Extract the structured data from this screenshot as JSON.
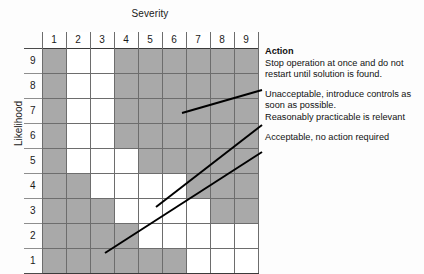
{
  "axes": {
    "x_title": "Severity",
    "y_title": "Likelihood",
    "x_ticks": [
      "1",
      "2",
      "3",
      "4",
      "5",
      "6",
      "7",
      "8",
      "9"
    ],
    "y_ticks": [
      "9",
      "8",
      "7",
      "6",
      "5",
      "4",
      "3",
      "2",
      "1"
    ]
  },
  "legend": {
    "action_heading": "Action",
    "action_line1": "Stop operation at once and do not",
    "action_line2": "restart until solution is found.",
    "unacceptable_line1": "Unacceptable, introduce controls as",
    "unacceptable_line2": "soon as possible.",
    "unacceptable_line3": "Reasonably practicable is relevant",
    "acceptable_line1": "Acceptable, no action required"
  },
  "colors": {
    "shaded_cell": "#a9a9a9",
    "empty_cell": "#ffffff",
    "grid_line": "#6d6d6d",
    "leader_line": "#000000",
    "text": "#111111"
  },
  "chart_data": {
    "type": "heatmap",
    "xlabel": "Severity",
    "ylabel": "Likelihood",
    "x": [
      1,
      2,
      3,
      4,
      5,
      6,
      7,
      8,
      9
    ],
    "y": [
      9,
      8,
      7,
      6,
      5,
      4,
      3,
      2,
      1
    ],
    "grid": true,
    "legend_position": "right",
    "value_labels": {
      "1": "shaded",
      "0": "unshaded"
    },
    "rows": [
      {
        "likelihood": 9,
        "values": [
          1,
          0,
          0,
          1,
          1,
          1,
          1,
          1,
          1
        ]
      },
      {
        "likelihood": 8,
        "values": [
          1,
          0,
          0,
          1,
          1,
          1,
          1,
          1,
          1
        ]
      },
      {
        "likelihood": 7,
        "values": [
          1,
          0,
          0,
          1,
          1,
          1,
          1,
          1,
          1
        ]
      },
      {
        "likelihood": 6,
        "values": [
          1,
          0,
          0,
          1,
          1,
          1,
          1,
          1,
          1
        ]
      },
      {
        "likelihood": 5,
        "values": [
          1,
          0,
          0,
          0,
          1,
          1,
          1,
          1,
          1
        ]
      },
      {
        "likelihood": 4,
        "values": [
          1,
          1,
          0,
          0,
          0,
          0,
          1,
          1,
          1
        ]
      },
      {
        "likelihood": 3,
        "values": [
          1,
          1,
          1,
          0,
          0,
          0,
          0,
          1,
          1
        ]
      },
      {
        "likelihood": 2,
        "values": [
          1,
          1,
          1,
          1,
          0,
          0,
          0,
          0,
          0
        ]
      },
      {
        "likelihood": 1,
        "values": [
          1,
          1,
          1,
          1,
          1,
          1,
          0,
          0,
          0
        ]
      }
    ],
    "annotations": [
      {
        "text": "Action / Stop operation at once and do not restart until solution is found.",
        "points_to": "upper shaded band"
      },
      {
        "text": "Unacceptable, introduce controls as soon as possible. Reasonably practicable is relevant",
        "points_to": "middle shaded band"
      },
      {
        "text": "Acceptable, no action required",
        "points_to": "lower unshaded band"
      }
    ]
  }
}
